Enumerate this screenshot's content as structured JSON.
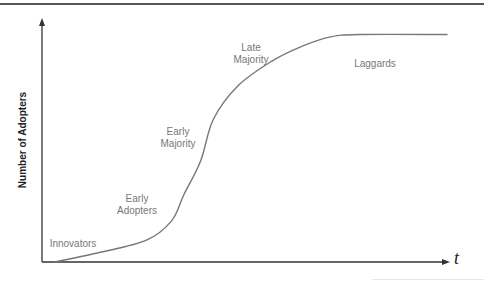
{
  "chart_data": {
    "type": "line",
    "title": "",
    "xlabel": "t",
    "ylabel": "Number of Adopters",
    "grid": false,
    "legend": null,
    "x": [
      3,
      14,
      25,
      31,
      34,
      38,
      41,
      47,
      55,
      62,
      69,
      76,
      97
    ],
    "series": [
      {
        "name": "Cumulative adopters (S-curve)",
        "values": [
          0,
          4,
          9,
          17,
          28,
          42,
          59,
          73,
          83,
          89,
          93,
          94,
          94
        ]
      }
    ],
    "xlim": [
      0,
      100
    ],
    "ylim": [
      0,
      100
    ],
    "annotations": [
      {
        "text": "Innovators",
        "x": 7,
        "y": 14
      },
      {
        "text": "Early Adopters",
        "x": 23,
        "y": 30
      },
      {
        "text": "Early Majority",
        "x": 33,
        "y": 57
      },
      {
        "text": "Late Majority",
        "x": 48,
        "y": 91
      },
      {
        "text": "Laggards",
        "x": 75,
        "y": 81
      }
    ]
  },
  "axes": {
    "y_label": "Number of Adopters",
    "x_label": "t"
  },
  "segments": {
    "innovators": "Innovators",
    "early_adopters": "Early\nAdopters",
    "early_majority": "Early\nMajority",
    "late_majority": "Late\nMajority",
    "laggards": "Laggards"
  },
  "colors": {
    "axis": "#333333",
    "curve": "#777777",
    "label": "#777777",
    "rule": "#555555"
  }
}
